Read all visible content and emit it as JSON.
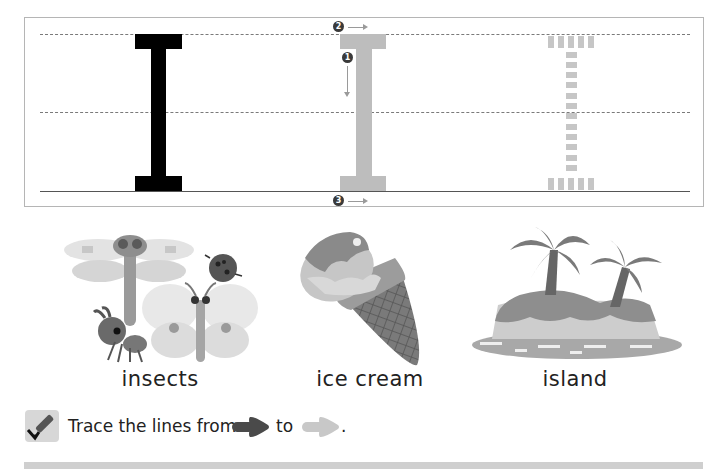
{
  "worksheet": {
    "letter": "I",
    "trace_guides": {
      "stroke_markers": [
        {
          "number": "1",
          "glyph": "❶",
          "direction": "down"
        },
        {
          "number": "2",
          "glyph": "❷",
          "direction": "right"
        },
        {
          "number": "3",
          "glyph": "❸",
          "direction": "right"
        }
      ]
    },
    "pictures": [
      {
        "label": "insects",
        "icon": "insects-illustration"
      },
      {
        "label": "ice cream",
        "icon": "ice-cream-illustration"
      },
      {
        "label": "island",
        "icon": "island-illustration"
      }
    ],
    "instruction": {
      "icon": "crayon-check-icon",
      "text_before": "Trace the lines from",
      "text_middle": "to",
      "text_after": ".",
      "from_arrow_color": "#4a4a4a",
      "to_arrow_color": "#c8c8c8"
    }
  }
}
